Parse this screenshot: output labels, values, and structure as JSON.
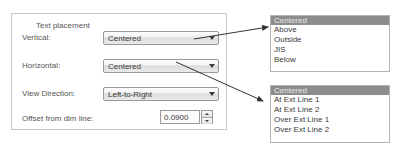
{
  "groupbox": {
    "title": "Text placement"
  },
  "fields": {
    "vertical": {
      "label": "Vertical:",
      "value": "Centered"
    },
    "horizontal": {
      "label": "Horizontal:",
      "value": "Centered"
    },
    "view_direction": {
      "label": "View Direction:",
      "value": "Left-to-Right"
    },
    "offset": {
      "label": "Offset from dim line:",
      "value": "0.0900"
    }
  },
  "lists": {
    "vertical_options": {
      "items": [
        "Centered",
        "Above",
        "Outside",
        "JIS",
        "Below"
      ],
      "selected_index": 0
    },
    "horizontal_options": {
      "items": [
        "Centered",
        "At Ext Line 1",
        "At Ext Line 2",
        "Over Ext Line 1",
        "Over Ext Line 2"
      ],
      "selected_index": 0
    }
  },
  "icons": {
    "dropdown_arrow": "chevron-down-icon",
    "spinner_up": "spinner-up-icon",
    "spinner_down": "spinner-down-icon"
  },
  "colors": {
    "selection_background": "#8c8c8c",
    "selection_text": "#e8e8e8",
    "border": "#9a9a9a",
    "groupbox_border": "#c8c8c8",
    "text": "#555555",
    "arrow": "#3c3c3c"
  }
}
